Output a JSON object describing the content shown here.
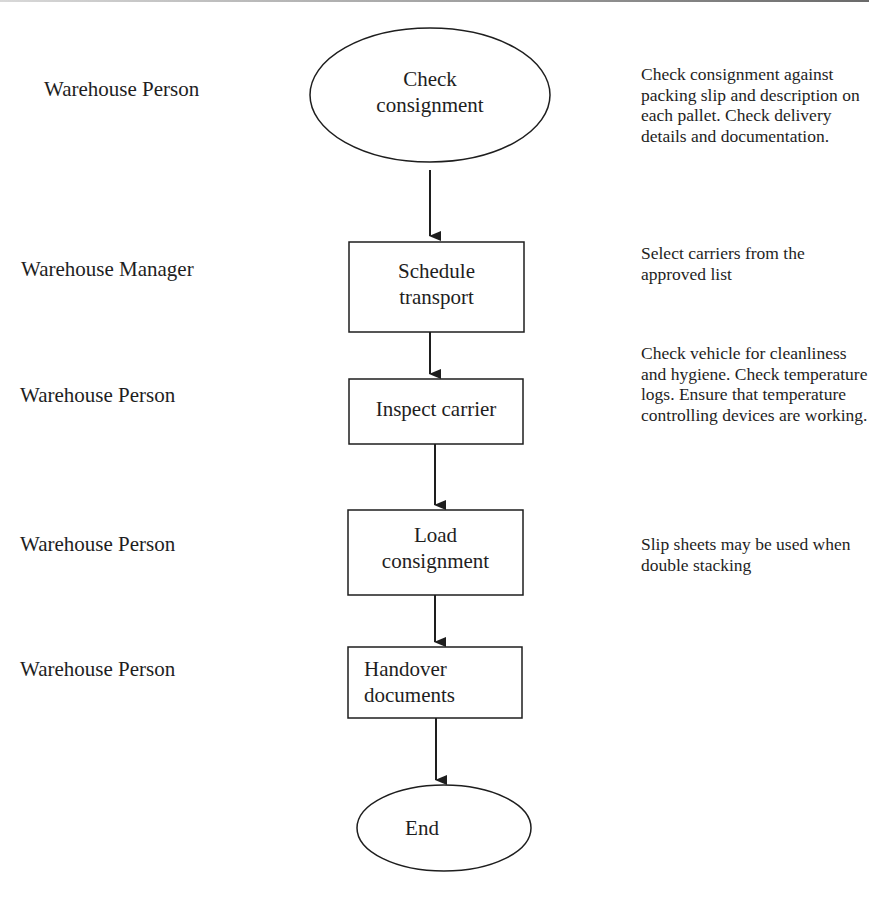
{
  "diagram": {
    "type": "flowchart",
    "direction": "top-to-bottom",
    "colors": {
      "stroke": "#1e1e1e",
      "text": "#1e1e1e",
      "background": "#ffffff"
    },
    "steps": [
      {
        "id": "check",
        "shape": "ellipse",
        "label_line1": "Check",
        "label_line2": "consignment",
        "role": "Warehouse Person",
        "note": "Check consignment against packing slip and description on each pallet. Check delivery details and documentation."
      },
      {
        "id": "schedule",
        "shape": "rectangle",
        "label_line1": "Schedule",
        "label_line2": "transport",
        "role": "Warehouse Manager",
        "note": "Select carriers from the approved list"
      },
      {
        "id": "inspect",
        "shape": "rectangle",
        "label_line1": "Inspect carrier",
        "label_line2": "",
        "role": "Warehouse Person",
        "note": "Check vehicle for cleanliness and hygiene. Check temperature logs. Ensure that temperature controlling devices are working."
      },
      {
        "id": "load",
        "shape": "rectangle",
        "label_line1": "Load",
        "label_line2": "consignment",
        "role": "Warehouse Person",
        "note": "Slip sheets may be used when double stacking"
      },
      {
        "id": "handover",
        "shape": "rectangle",
        "label_line1": "Handover",
        "label_line2": "documents",
        "role": "Warehouse Person",
        "note": ""
      },
      {
        "id": "end",
        "shape": "ellipse",
        "label_line1": "End",
        "label_line2": "",
        "role": "",
        "note": ""
      }
    ],
    "edges": [
      {
        "from": "check",
        "to": "schedule"
      },
      {
        "from": "schedule",
        "to": "inspect"
      },
      {
        "from": "inspect",
        "to": "load"
      },
      {
        "from": "load",
        "to": "handover"
      },
      {
        "from": "handover",
        "to": "end"
      }
    ]
  }
}
